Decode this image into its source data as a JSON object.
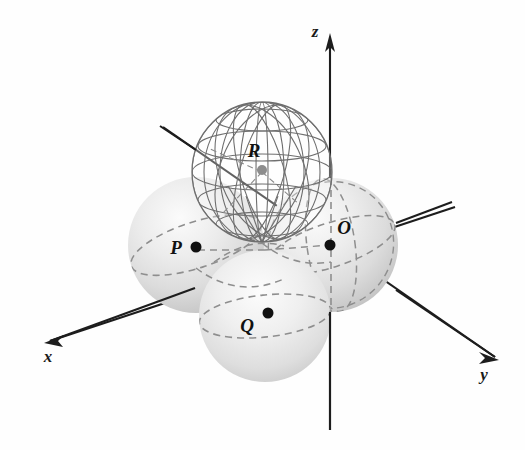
{
  "figure": {
    "background_color": "#fefefe"
  },
  "axes": {
    "color": "#1d1d1d",
    "items": [
      {
        "name": "z-axis",
        "label": "z",
        "label_x": 315,
        "label_y": 37,
        "line": {
          "x1": 330,
          "y1": 430,
          "x2": 330,
          "y2": 40
        },
        "arrow": "up"
      },
      {
        "name": "x-axis",
        "label": "x",
        "label_x": 48,
        "label_y": 362,
        "line": {
          "x1": 455,
          "y1": 207,
          "x2": 50,
          "y2": 341
        },
        "arrow": "down-left"
      },
      {
        "name": "y-axis",
        "label": "y",
        "label_x": 484,
        "label_y": 380,
        "line": {
          "x1": 163,
          "y1": 127,
          "x2": 495,
          "y2": 357
        },
        "arrow": "down-right"
      }
    ]
  },
  "spheres": [
    {
      "id": "P",
      "label": "P",
      "style": "shaded",
      "cx": 196,
      "cy": 245,
      "r": 68,
      "label_x": 176,
      "label_y": 254,
      "dot_x": 196,
      "dot_y": 247,
      "dot_color": "#111111",
      "dot_r": 5.5
    },
    {
      "id": "O",
      "label": "O",
      "style": "shaded",
      "cx": 331,
      "cy": 245,
      "r": 67,
      "label_x": 344,
      "label_y": 234,
      "dot_x": 330,
      "dot_y": 245,
      "dot_color": "#111111",
      "dot_r": 5.5
    },
    {
      "id": "Q",
      "label": "Q",
      "style": "shaded",
      "cx": 265,
      "cy": 316,
      "r": 66,
      "label_x": 247,
      "label_y": 332,
      "dot_x": 268,
      "dot_y": 313,
      "dot_color": "#111111",
      "dot_r": 5.5
    },
    {
      "id": "R",
      "label": "R",
      "style": "wireframe",
      "cx": 262,
      "cy": 172,
      "r": 70,
      "label_x": 254,
      "label_y": 157,
      "dot_x": 262,
      "dot_y": 170,
      "dot_color": "#8d8d8d",
      "dot_r": 5
    }
  ],
  "colors": {
    "sphere_fill_light": "#f2f2f2",
    "sphere_fill_mid": "#d8d8d8",
    "sphere_fill_dark": "#bcbcbc",
    "wireframe_stroke": "#6f6f6f",
    "dashed_equator": "#8e8e8e",
    "axis": "#1d1d1d",
    "label_text": "#111111"
  },
  "leader_lines": [
    {
      "name": "leader-to-R",
      "x1": 160,
      "y1": 126,
      "x2": 196,
      "y2": 150
    },
    {
      "name": "leader-to-O",
      "x1": 396,
      "y1": 223,
      "x2": 452,
      "y2": 202
    }
  ]
}
